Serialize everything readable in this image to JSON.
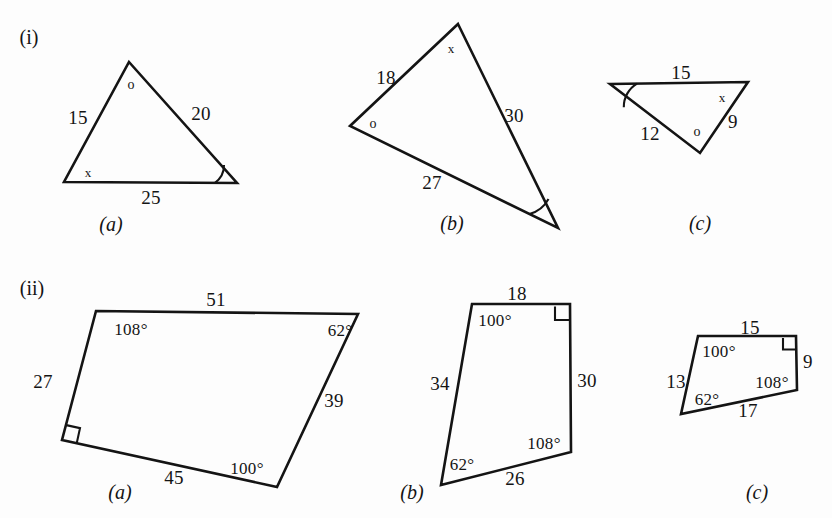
{
  "figure": {
    "kind": "geometry-exercise-figure",
    "rows": [
      {
        "tag": "(i)",
        "shape_type": "triangle",
        "items": [
          {
            "caption": "(a)",
            "side_labels": [
              "15",
              "20",
              "25"
            ],
            "angle_marks": [
              "o",
              "x",
              "arc"
            ]
          },
          {
            "caption": "(b)",
            "side_labels": [
              "18",
              "30",
              "27"
            ],
            "angle_marks": [
              "x",
              "o",
              "arc"
            ]
          },
          {
            "caption": "(c)",
            "side_labels": [
              "15",
              "12",
              "9"
            ],
            "angle_marks": [
              "arc",
              "x",
              "o"
            ]
          }
        ]
      },
      {
        "tag": "(ii)",
        "shape_type": "quadrilateral",
        "items": [
          {
            "caption": "(a)",
            "side_labels": [
              "51",
              "39",
              "45",
              "27"
            ],
            "angle_labels": [
              "108°",
              "62°",
              "100°"
            ],
            "right_angle": true
          },
          {
            "caption": "(b)",
            "side_labels": [
              "18",
              "30",
              "26",
              "34"
            ],
            "angle_labels": [
              "100°",
              "108°",
              "62°"
            ],
            "right_angle": true
          },
          {
            "caption": "(c)",
            "side_labels": [
              "15",
              "9",
              "17",
              "13"
            ],
            "angle_labels": [
              "100°",
              "108°",
              "62°"
            ],
            "right_angle": true
          }
        ]
      }
    ]
  },
  "row_tags": {
    "row_i": "(i)",
    "row_ii": "(ii)"
  },
  "tri_a": {
    "s_left": "15",
    "s_right": "20",
    "s_base": "25",
    "m_apex": "o",
    "m_bl": "x"
  },
  "tri_b": {
    "s_upleft": "18",
    "s_right": "30",
    "s_base": "27",
    "m_top": "x",
    "m_left": "o"
  },
  "tri_c": {
    "s_top": "15",
    "s_left": "12",
    "s_right": "9",
    "m_topright": "x",
    "m_bottom": "o"
  },
  "quad_a": {
    "s_top": "51",
    "s_right": "39",
    "s_bottom": "45",
    "s_left": "27",
    "a_tl": "108°",
    "a_tr": "62°",
    "a_br": "100°"
  },
  "quad_b": {
    "s_top": "18",
    "s_right": "30",
    "s_bottom": "26",
    "s_left": "34",
    "a_tl": "100°",
    "a_br": "108°",
    "a_bl": "62°"
  },
  "quad_c": {
    "s_top": "15",
    "s_right": "9",
    "s_bottom": "17",
    "s_left": "13",
    "a_tl": "100°",
    "a_br": "108°",
    "a_bl": "62°"
  },
  "captions": {
    "i_a": "(a)",
    "i_b": "(b)",
    "i_c": "(c)",
    "ii_a": "(a)",
    "ii_b": "(b)",
    "ii_c": "(c)"
  },
  "colors": {
    "ink": "#141414",
    "paper": "#fdfdfd"
  }
}
